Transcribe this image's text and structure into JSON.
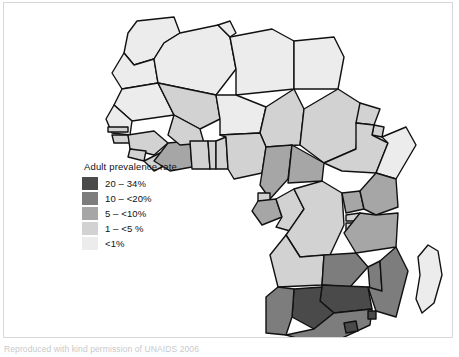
{
  "figure": {
    "caption": "Reproduced with kind permission of UNAIDS 2006"
  },
  "legend": {
    "title": "Adult prevalence rate",
    "items": [
      {
        "label": "20 – 34%",
        "color": "#4a4a4a",
        "min": 20,
        "max": 34
      },
      {
        "label": "10 – <20%",
        "color": "#7d7d7d",
        "min": 10,
        "max": 20
      },
      {
        "label": "5 – <10%",
        "color": "#a6a6a6",
        "min": 5,
        "max": 10
      },
      {
        "label": "1 – <5 %",
        "color": "#d2d2d2",
        "min": 1,
        "max": 5
      },
      {
        "label": "<1%",
        "color": "#ececec",
        "min": 0,
        "max": 1
      }
    ]
  },
  "map_data": {
    "type": "choropleth",
    "region": "Africa",
    "variable": "Adult HIV prevalence rate",
    "units": "percent",
    "ocean_color": "#ffffff",
    "border_color": "#111111",
    "regions": [
      {
        "name": "Morocco",
        "band": "<1%",
        "color": "#ececec"
      },
      {
        "name": "Western Sahara",
        "band": "<1%",
        "color": "#ececec"
      },
      {
        "name": "Algeria",
        "band": "<1%",
        "color": "#ececec"
      },
      {
        "name": "Tunisia",
        "band": "<1%",
        "color": "#ececec"
      },
      {
        "name": "Libya",
        "band": "<1%",
        "color": "#ececec"
      },
      {
        "name": "Egypt",
        "band": "<1%",
        "color": "#ececec"
      },
      {
        "name": "Mauritania",
        "band": "<1%",
        "color": "#ececec"
      },
      {
        "name": "Mali",
        "band": "1 – <5 %",
        "color": "#d2d2d2"
      },
      {
        "name": "Niger",
        "band": "<1%",
        "color": "#ececec"
      },
      {
        "name": "Chad",
        "band": "1 – <5 %",
        "color": "#d2d2d2"
      },
      {
        "name": "Sudan",
        "band": "1 – <5 %",
        "color": "#d2d2d2"
      },
      {
        "name": "Eritrea",
        "band": "1 – <5 %",
        "color": "#d2d2d2"
      },
      {
        "name": "Djibouti",
        "band": "1 – <5 %",
        "color": "#d2d2d2"
      },
      {
        "name": "Ethiopia",
        "band": "1 – <5 %",
        "color": "#d2d2d2"
      },
      {
        "name": "Somalia",
        "band": "<1%",
        "color": "#ececec"
      },
      {
        "name": "Senegal",
        "band": "<1%",
        "color": "#ececec"
      },
      {
        "name": "Gambia",
        "band": "1 – <5 %",
        "color": "#d2d2d2"
      },
      {
        "name": "Guinea-Bissau",
        "band": "1 – <5 %",
        "color": "#d2d2d2"
      },
      {
        "name": "Guinea",
        "band": "1 – <5 %",
        "color": "#d2d2d2"
      },
      {
        "name": "Sierra Leone",
        "band": "1 – <5 %",
        "color": "#d2d2d2"
      },
      {
        "name": "Liberia",
        "band": "1 – <5 %",
        "color": "#d2d2d2"
      },
      {
        "name": "Côte d'Ivoire",
        "band": "5 – <10%",
        "color": "#a6a6a6"
      },
      {
        "name": "Burkina Faso",
        "band": "1 – <5 %",
        "color": "#d2d2d2"
      },
      {
        "name": "Ghana",
        "band": "1 – <5 %",
        "color": "#d2d2d2"
      },
      {
        "name": "Togo",
        "band": "1 – <5 %",
        "color": "#d2d2d2"
      },
      {
        "name": "Benin",
        "band": "1 – <5 %",
        "color": "#d2d2d2"
      },
      {
        "name": "Nigeria",
        "band": "1 – <5 %",
        "color": "#d2d2d2"
      },
      {
        "name": "Cameroon",
        "band": "5 – <10%",
        "color": "#a6a6a6"
      },
      {
        "name": "Central African Republic",
        "band": "5 – <10%",
        "color": "#a6a6a6"
      },
      {
        "name": "Equatorial Guinea",
        "band": "1 – <5 %",
        "color": "#d2d2d2"
      },
      {
        "name": "Gabon",
        "band": "5 – <10%",
        "color": "#a6a6a6"
      },
      {
        "name": "Congo",
        "band": "1 – <5 %",
        "color": "#d2d2d2"
      },
      {
        "name": "Democratic Republic of the Congo",
        "band": "1 – <5 %",
        "color": "#d2d2d2"
      },
      {
        "name": "Uganda",
        "band": "5 – <10%",
        "color": "#a6a6a6"
      },
      {
        "name": "Rwanda",
        "band": "1 – <5 %",
        "color": "#d2d2d2"
      },
      {
        "name": "Burundi",
        "band": "1 – <5 %",
        "color": "#d2d2d2"
      },
      {
        "name": "Kenya",
        "band": "5 – <10%",
        "color": "#a6a6a6"
      },
      {
        "name": "Tanzania",
        "band": "5 – <10%",
        "color": "#a6a6a6"
      },
      {
        "name": "Angola",
        "band": "1 – <5 %",
        "color": "#d2d2d2"
      },
      {
        "name": "Zambia",
        "band": "10 – <20%",
        "color": "#7d7d7d"
      },
      {
        "name": "Malawi",
        "band": "10 – <20%",
        "color": "#7d7d7d"
      },
      {
        "name": "Mozambique",
        "band": "10 – <20%",
        "color": "#7d7d7d"
      },
      {
        "name": "Zimbabwe",
        "band": "20 – 34%",
        "color": "#4a4a4a"
      },
      {
        "name": "Botswana",
        "band": "20 – 34%",
        "color": "#4a4a4a"
      },
      {
        "name": "Namibia",
        "band": "10 – <20%",
        "color": "#7d7d7d"
      },
      {
        "name": "South Africa",
        "band": "10 – <20%",
        "color": "#7d7d7d"
      },
      {
        "name": "Lesotho",
        "band": "20 – 34%",
        "color": "#4a4a4a"
      },
      {
        "name": "Swaziland",
        "band": "20 – 34%",
        "color": "#4a4a4a"
      },
      {
        "name": "Madagascar",
        "band": "<1%",
        "color": "#ececec"
      }
    ]
  }
}
